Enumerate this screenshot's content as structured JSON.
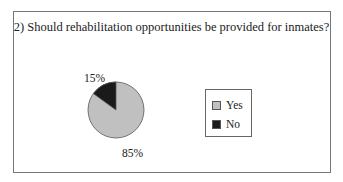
{
  "chart_data": {
    "type": "pie",
    "title": "2) Should rehabilitation opportunities be provided for inmates?",
    "categories": [
      "Yes",
      "No"
    ],
    "values": [
      85,
      15
    ],
    "labels": [
      "85%",
      "15%"
    ],
    "colors": [
      "#c0c0c0",
      "#1a1a1a"
    ],
    "legend": {
      "position": "right",
      "entries": [
        "Yes",
        "No"
      ]
    }
  }
}
